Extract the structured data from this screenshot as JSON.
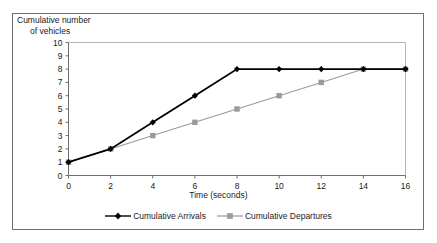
{
  "chart_data": {
    "type": "line",
    "title": "",
    "xlabel": "Time (seconds)",
    "ylabel": "Cumulative number of vehicles",
    "ylabel_line1": "Cumulative number",
    "ylabel_line2": "of vehicles",
    "x": [
      0,
      2,
      4,
      6,
      8,
      10,
      12,
      14,
      16
    ],
    "xlim": [
      0,
      16
    ],
    "ylim": [
      0,
      10
    ],
    "xticks": [
      "0",
      "2",
      "4",
      "6",
      "8",
      "10",
      "12",
      "14",
      "16"
    ],
    "yticks": [
      "0",
      "1",
      "2",
      "3",
      "4",
      "5",
      "6",
      "7",
      "8",
      "9",
      "10"
    ],
    "grid": false,
    "legend_position": "bottom",
    "series": [
      {
        "name": "Cumulative Arrivals",
        "color": "#000000",
        "marker": "diamond",
        "values": [
          1,
          2,
          4,
          6,
          8,
          8,
          8,
          8,
          8
        ]
      },
      {
        "name": "Cumulative Departures",
        "color": "#9a9a9a",
        "marker": "square",
        "values": [
          1,
          2,
          3,
          4,
          5,
          6,
          7,
          8,
          8
        ]
      }
    ]
  },
  "frame": {
    "border_color": "#6f6f6f",
    "plot_border_color": "#b5b5b5",
    "axis_color": "#6f6f6f"
  }
}
